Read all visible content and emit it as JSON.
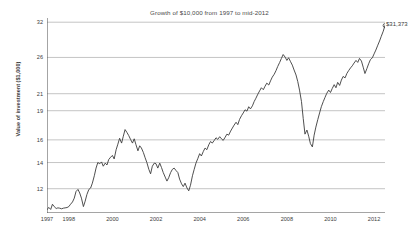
{
  "chart_data": {
    "type": "line",
    "title": "Growth of $10,000 from 1997 to mid-2012",
    "xlabel": "",
    "ylabel": "Value of investment ($1,000)",
    "yscale": "log",
    "ylim": [
      10.4,
      32.8
    ],
    "xlim": [
      1997.0,
      2012.5
    ],
    "grid": true,
    "legend": false,
    "y_ticks": [
      32,
      26,
      21,
      19,
      16,
      14,
      12
    ],
    "y_tick_labels": [
      "32",
      "26",
      "21",
      "19",
      "16",
      "14",
      "12"
    ],
    "x_ticks": [
      1997,
      1998,
      2000,
      2002,
      2004,
      2006,
      2008,
      2010,
      2012
    ],
    "x_tick_labels": [
      "1997",
      "1998",
      "2000",
      "2002",
      "2004",
      "2006",
      "2008",
      "2010",
      "2012"
    ],
    "end_value_label": "$31,373",
    "end_point": {
      "x": 2012.5,
      "y": 31.373
    },
    "series": [
      {
        "name": "Value of investment",
        "units": "thousands of dollars",
        "x": [
          1997.0,
          1997.08,
          1997.17,
          1997.25,
          1997.33,
          1997.42,
          1997.5,
          1997.58,
          1997.67,
          1997.75,
          1997.83,
          1997.92,
          1998.0,
          1998.08,
          1998.17,
          1998.25,
          1998.33,
          1998.42,
          1998.5,
          1998.58,
          1998.67,
          1998.75,
          1998.83,
          1998.92,
          1999.0,
          1999.08,
          1999.17,
          1999.25,
          1999.33,
          1999.42,
          1999.5,
          1999.58,
          1999.67,
          1999.75,
          1999.83,
          1999.92,
          2000.0,
          2000.08,
          2000.17,
          2000.25,
          2000.33,
          2000.42,
          2000.5,
          2000.58,
          2000.67,
          2000.75,
          2000.83,
          2000.92,
          2001.0,
          2001.08,
          2001.17,
          2001.25,
          2001.33,
          2001.42,
          2001.5,
          2001.58,
          2001.67,
          2001.75,
          2001.83,
          2001.92,
          2002.0,
          2002.08,
          2002.17,
          2002.25,
          2002.33,
          2002.42,
          2002.5,
          2002.58,
          2002.67,
          2002.75,
          2002.83,
          2002.92,
          2003.0,
          2003.08,
          2003.17,
          2003.25,
          2003.33,
          2003.42,
          2003.5,
          2003.58,
          2003.67,
          2003.75,
          2003.83,
          2003.92,
          2004.0,
          2004.08,
          2004.17,
          2004.25,
          2004.33,
          2004.42,
          2004.5,
          2004.58,
          2004.67,
          2004.75,
          2004.83,
          2004.92,
          2005.0,
          2005.08,
          2005.17,
          2005.25,
          2005.33,
          2005.42,
          2005.5,
          2005.58,
          2005.67,
          2005.75,
          2005.83,
          2005.92,
          2006.0,
          2006.08,
          2006.17,
          2006.25,
          2006.33,
          2006.42,
          2006.5,
          2006.58,
          2006.67,
          2006.75,
          2006.83,
          2006.92,
          2007.0,
          2007.08,
          2007.17,
          2007.25,
          2007.33,
          2007.42,
          2007.5,
          2007.58,
          2007.67,
          2007.75,
          2007.83,
          2007.92,
          2008.0,
          2008.08,
          2008.17,
          2008.25,
          2008.33,
          2008.42,
          2008.5,
          2008.58,
          2008.67,
          2008.75,
          2008.83,
          2008.92,
          2009.0,
          2009.08,
          2009.17,
          2009.25,
          2009.33,
          2009.42,
          2009.5,
          2009.58,
          2009.67,
          2009.75,
          2009.83,
          2009.92,
          2010.0,
          2010.08,
          2010.17,
          2010.25,
          2010.33,
          2010.42,
          2010.5,
          2010.58,
          2010.67,
          2010.75,
          2010.83,
          2010.92,
          2011.0,
          2011.08,
          2011.17,
          2011.25,
          2011.33,
          2011.42,
          2011.5,
          2011.58,
          2011.67,
          2011.75,
          2011.83,
          2011.92,
          2012.0,
          2012.08,
          2012.17,
          2012.25,
          2012.33,
          2012.42,
          2012.5
        ],
        "y": [
          10.6,
          10.75,
          10.62,
          10.95,
          10.8,
          10.68,
          10.72,
          10.7,
          10.66,
          10.7,
          10.72,
          10.74,
          10.8,
          10.95,
          11.1,
          11.35,
          11.8,
          11.95,
          11.7,
          11.35,
          10.8,
          11.15,
          11.6,
          11.95,
          12.05,
          12.4,
          12.95,
          13.55,
          14.0,
          13.9,
          14.05,
          13.7,
          13.95,
          13.8,
          14.25,
          14.45,
          14.6,
          14.3,
          15.1,
          15.6,
          16.15,
          15.7,
          16.35,
          17.0,
          16.7,
          16.4,
          16.05,
          15.7,
          16.1,
          15.55,
          15.0,
          15.45,
          15.25,
          14.85,
          14.4,
          14.0,
          13.45,
          13.1,
          13.7,
          13.95,
          13.9,
          13.55,
          13.95,
          13.6,
          13.2,
          12.85,
          12.55,
          12.8,
          13.2,
          13.45,
          13.55,
          13.35,
          13.2,
          12.7,
          12.35,
          12.15,
          12.4,
          12.05,
          11.85,
          12.25,
          12.95,
          13.45,
          13.95,
          14.35,
          14.75,
          14.55,
          14.95,
          15.25,
          15.1,
          15.55,
          15.85,
          15.7,
          15.95,
          16.2,
          16.05,
          16.3,
          16.1,
          15.95,
          16.25,
          16.55,
          16.45,
          16.85,
          17.15,
          17.45,
          17.75,
          17.5,
          18.05,
          18.45,
          18.75,
          19.1,
          18.95,
          19.45,
          19.2,
          19.55,
          20.05,
          20.45,
          20.95,
          21.35,
          21.75,
          21.5,
          21.95,
          22.35,
          22.1,
          22.65,
          23.15,
          23.55,
          24.05,
          24.65,
          25.25,
          25.85,
          26.45,
          26.05,
          25.55,
          25.95,
          25.35,
          24.85,
          24.15,
          23.45,
          22.55,
          21.45,
          20.05,
          18.15,
          16.55,
          16.95,
          16.35,
          15.65,
          15.35,
          16.45,
          17.25,
          18.05,
          18.75,
          19.45,
          20.05,
          20.55,
          21.05,
          21.45,
          21.15,
          21.65,
          22.15,
          21.75,
          22.45,
          22.05,
          22.75,
          23.25,
          23.05,
          23.65,
          24.05,
          24.45,
          24.75,
          25.15,
          25.55,
          25.25,
          25.85,
          25.45,
          24.55,
          23.65,
          24.35,
          25.05,
          25.65,
          25.95,
          26.55,
          27.15,
          27.95,
          28.65,
          29.45,
          30.35,
          31.373
        ]
      }
    ]
  },
  "annotations": {
    "end_label": "$31,373"
  },
  "colors": {
    "line": "#3b3b3b",
    "grid": "#9d9d9d",
    "axis": "#4a4a4a",
    "text": "#3d3d3d",
    "background": "#ffffff"
  }
}
